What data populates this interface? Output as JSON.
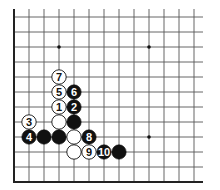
{
  "diagram": {
    "type": "go-board-corner",
    "grid": {
      "origin_x": 14,
      "origin_y": 17,
      "spacing": 15,
      "columns": 13,
      "rows": 12,
      "line_color": "#555555",
      "edge_color": "#222222"
    },
    "star_points": [
      {
        "col": 3,
        "row": 2
      },
      {
        "col": 9,
        "row": 2
      },
      {
        "col": 9,
        "row": 8
      }
    ],
    "stones": [
      {
        "col": 3,
        "row": 6,
        "color": "white",
        "label": "1"
      },
      {
        "col": 4,
        "row": 6,
        "color": "black",
        "label": "2"
      },
      {
        "col": 1,
        "row": 7,
        "color": "white",
        "label": "3"
      },
      {
        "col": 1,
        "row": 8,
        "color": "black",
        "label": "4"
      },
      {
        "col": 3,
        "row": 5,
        "color": "white",
        "label": "5"
      },
      {
        "col": 4,
        "row": 5,
        "color": "black",
        "label": "6"
      },
      {
        "col": 3,
        "row": 4,
        "color": "white",
        "label": "7"
      },
      {
        "col": 5,
        "row": 8,
        "color": "black",
        "label": "8"
      },
      {
        "col": 5,
        "row": 9,
        "color": "white",
        "label": "9"
      },
      {
        "col": 6,
        "row": 9,
        "color": "black",
        "label": "10"
      },
      {
        "col": 3,
        "row": 7,
        "color": "white",
        "label": ""
      },
      {
        "col": 4,
        "row": 7,
        "color": "black",
        "label": ""
      },
      {
        "col": 2,
        "row": 8,
        "color": "black",
        "label": ""
      },
      {
        "col": 3,
        "row": 8,
        "color": "black",
        "label": ""
      },
      {
        "col": 4,
        "row": 8,
        "color": "white",
        "label": ""
      },
      {
        "col": 4,
        "row": 9,
        "color": "white",
        "label": ""
      },
      {
        "col": 7,
        "row": 9,
        "color": "black",
        "label": ""
      }
    ]
  }
}
